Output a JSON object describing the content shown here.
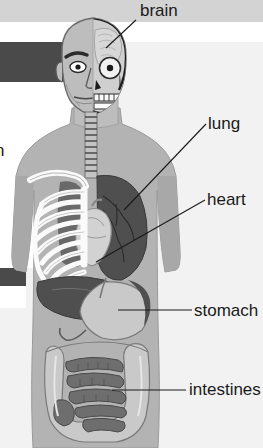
{
  "diagram": {
    "labels": [
      {
        "id": "brain",
        "text": "brain"
      },
      {
        "id": "lung",
        "text": "lung"
      },
      {
        "id": "heart",
        "text": "heart"
      },
      {
        "id": "stomach",
        "text": "stomach"
      },
      {
        "id": "intestines",
        "text": "intestines"
      }
    ],
    "clipped_label": {
      "text": "n"
    }
  },
  "colors": {
    "background": "#f2f2f2",
    "band_light": "#d3d3d3",
    "band_white": "#ffffff",
    "band_dark": "#4a4a4a",
    "body_fill": "#b3b3b3",
    "body_outline": "#8f8f8f",
    "skin_light": "#bdbdbd",
    "skull_light": "#e8e8e8",
    "bone_white": "#f5f5f5",
    "organ_dark": "#4f4f4f",
    "organ_mid": "#6e6e6e",
    "organ_light": "#c9c9c9",
    "text": "#1a1a1a",
    "leader_line": "#1a1a1a"
  }
}
